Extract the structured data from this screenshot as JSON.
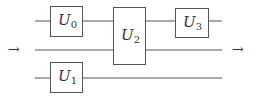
{
  "diagram": {
    "type": "quantum-circuit",
    "input_arrow": "→",
    "output_arrow": "→",
    "gates": [
      {
        "id": "U0",
        "symbol": "U",
        "subscript": "0"
      },
      {
        "id": "U1",
        "symbol": "U",
        "subscript": "1"
      },
      {
        "id": "U2",
        "symbol": "U",
        "subscript": "2"
      },
      {
        "id": "U3",
        "symbol": "U",
        "subscript": "3"
      }
    ],
    "colors": {
      "line": "#555555",
      "text": "#333333",
      "background": "#ffffff"
    }
  }
}
